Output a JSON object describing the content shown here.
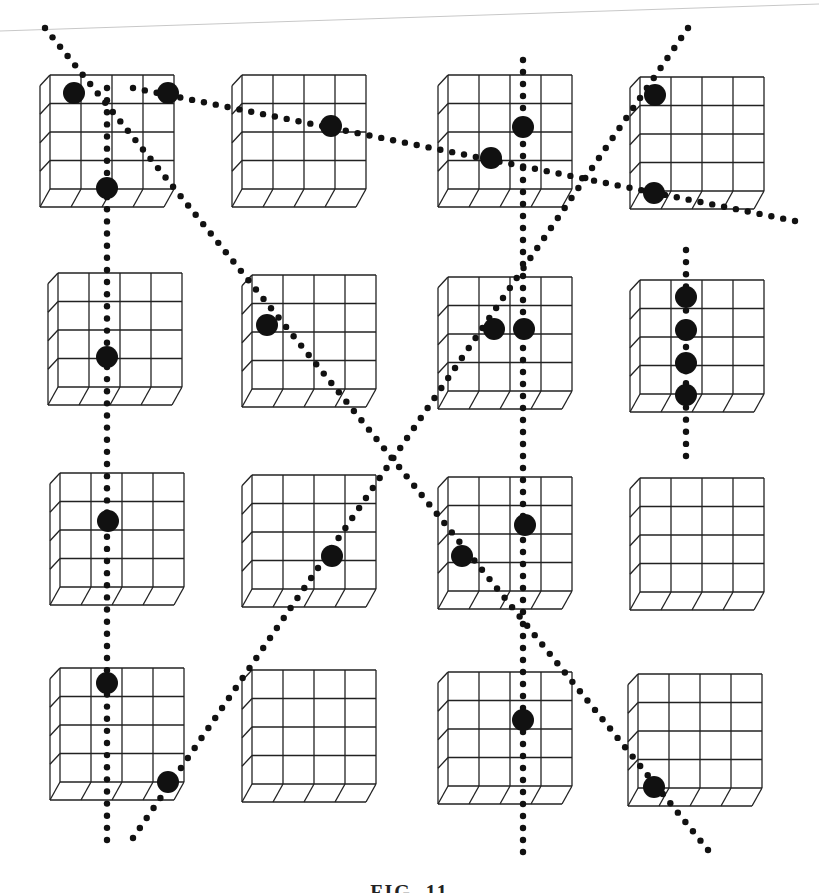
{
  "figure": {
    "caption": "FIG. 11",
    "colors": {
      "ink": "#111111",
      "grid": "#222222",
      "background": "#ffffff",
      "scan_line": "#c8c8c8"
    },
    "board_grid": {
      "rows": 4,
      "cols": 4,
      "cells_per_board": "4x4",
      "board_origins": [
        {
          "row": 0,
          "col": 0,
          "x": 50,
          "y": 75
        },
        {
          "row": 0,
          "col": 1,
          "x": 242,
          "y": 75
        },
        {
          "row": 0,
          "col": 2,
          "x": 448,
          "y": 75
        },
        {
          "row": 0,
          "col": 3,
          "x": 640,
          "y": 77
        },
        {
          "row": 1,
          "col": 0,
          "x": 58,
          "y": 273
        },
        {
          "row": 1,
          "col": 1,
          "x": 252,
          "y": 275
        },
        {
          "row": 1,
          "col": 2,
          "x": 448,
          "y": 277
        },
        {
          "row": 1,
          "col": 3,
          "x": 640,
          "y": 280
        },
        {
          "row": 2,
          "col": 0,
          "x": 60,
          "y": 473
        },
        {
          "row": 2,
          "col": 1,
          "x": 252,
          "y": 475
        },
        {
          "row": 2,
          "col": 2,
          "x": 448,
          "y": 477
        },
        {
          "row": 2,
          "col": 3,
          "x": 640,
          "y": 478
        },
        {
          "row": 3,
          "col": 0,
          "x": 60,
          "y": 668
        },
        {
          "row": 3,
          "col": 1,
          "x": 252,
          "y": 670
        },
        {
          "row": 3,
          "col": 2,
          "x": 448,
          "y": 672
        },
        {
          "row": 3,
          "col": 3,
          "x": 638,
          "y": 674
        }
      ],
      "face_width": 124,
      "face_height": 132,
      "depth_dx": -10,
      "depth_dy": 18
    },
    "pieces": [
      {
        "board": "r0c0",
        "x": 74,
        "y": 93
      },
      {
        "board": "r0c0",
        "x": 168,
        "y": 93
      },
      {
        "board": "r0c0",
        "x": 107,
        "y": 188
      },
      {
        "board": "r0c1",
        "x": 331,
        "y": 126
      },
      {
        "board": "r0c2",
        "x": 491,
        "y": 158
      },
      {
        "board": "r0c2",
        "x": 523,
        "y": 127
      },
      {
        "board": "r0c3",
        "x": 655,
        "y": 95
      },
      {
        "board": "r0c3",
        "x": 654,
        "y": 193
      },
      {
        "board": "r1c0",
        "x": 107,
        "y": 357
      },
      {
        "board": "r1c1",
        "x": 267,
        "y": 325
      },
      {
        "board": "r1c2",
        "x": 494,
        "y": 329
      },
      {
        "board": "r1c2",
        "x": 524,
        "y": 329
      },
      {
        "board": "r1c3",
        "x": 686,
        "y": 297
      },
      {
        "board": "r1c3",
        "x": 686,
        "y": 330
      },
      {
        "board": "r1c3",
        "x": 686,
        "y": 363
      },
      {
        "board": "r1c3",
        "x": 686,
        "y": 395
      },
      {
        "board": "r2c0",
        "x": 108,
        "y": 521
      },
      {
        "board": "r2c1",
        "x": 332,
        "y": 556
      },
      {
        "board": "r2c2",
        "x": 462,
        "y": 556
      },
      {
        "board": "r2c2",
        "x": 525,
        "y": 525
      },
      {
        "board": "r3c0",
        "x": 107,
        "y": 683
      },
      {
        "board": "r3c0",
        "x": 168,
        "y": 782
      },
      {
        "board": "r3c2",
        "x": 523,
        "y": 720
      },
      {
        "board": "r3c3",
        "x": 654,
        "y": 787
      }
    ],
    "piece_radius": 11,
    "dotted_lines": [
      {
        "id": "vertical-col1",
        "x1": 107,
        "y1": 88,
        "x2": 107,
        "y2": 840
      },
      {
        "id": "vertical-col3",
        "x1": 523,
        "y1": 60,
        "x2": 523,
        "y2": 852
      },
      {
        "id": "vertical-short-r2c4",
        "x1": 686,
        "y1": 250,
        "x2": 686,
        "y2": 456
      },
      {
        "id": "descending-diagonal",
        "x1": 45,
        "y1": 28,
        "x2": 708,
        "y2": 850
      },
      {
        "id": "shallow-diagonal-top",
        "x1": 133,
        "y1": 88,
        "x2": 795,
        "y2": 221
      },
      {
        "id": "ascending-diagonal",
        "x1": 133,
        "y1": 838,
        "x2": 688,
        "y2": 28
      }
    ],
    "dot_spacing": 12,
    "dot_radius": 3.2
  }
}
